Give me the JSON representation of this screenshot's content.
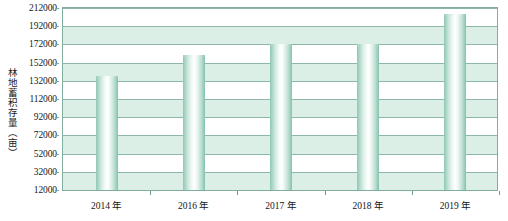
{
  "chart_data": {
    "type": "bar",
    "title": "",
    "subtitle": "",
    "xlabel": "",
    "ylabel": "林地蓄积存量（亩）",
    "categories": [
      "2014 年",
      "2016 年",
      "2017 年",
      "2018 年",
      "2019 年"
    ],
    "values": [
      137000,
      160000,
      172000,
      172000,
      205000
    ],
    "series": [
      {
        "name": "林地蓄积存量",
        "values": [
          137000,
          160000,
          172000,
          172000,
          205000
        ]
      }
    ],
    "ylim": [
      12000,
      212000
    ],
    "ytick_step": 20000,
    "yticks": [
      "212000",
      "192000",
      "172000",
      "152000",
      "132000",
      "112000",
      "92000",
      "72000",
      "52000",
      "32000",
      "12000"
    ],
    "ytick_values": [
      212000,
      192000,
      172000,
      152000,
      132000,
      112000,
      92000,
      72000,
      52000,
      32000,
      12000
    ],
    "grid": true,
    "grid_orientation": "horizontal",
    "banded_background": true,
    "legend": null,
    "legend_position": "none",
    "annotations": [],
    "colors": {
      "bar_edge": "#8fc7b4",
      "bar_center": "#ffffff",
      "gridline": "#8bb8a9",
      "band": "#dcefe6",
      "plot_border": "#7fae9f",
      "text": "#161616",
      "background": "#ffffff"
    }
  }
}
